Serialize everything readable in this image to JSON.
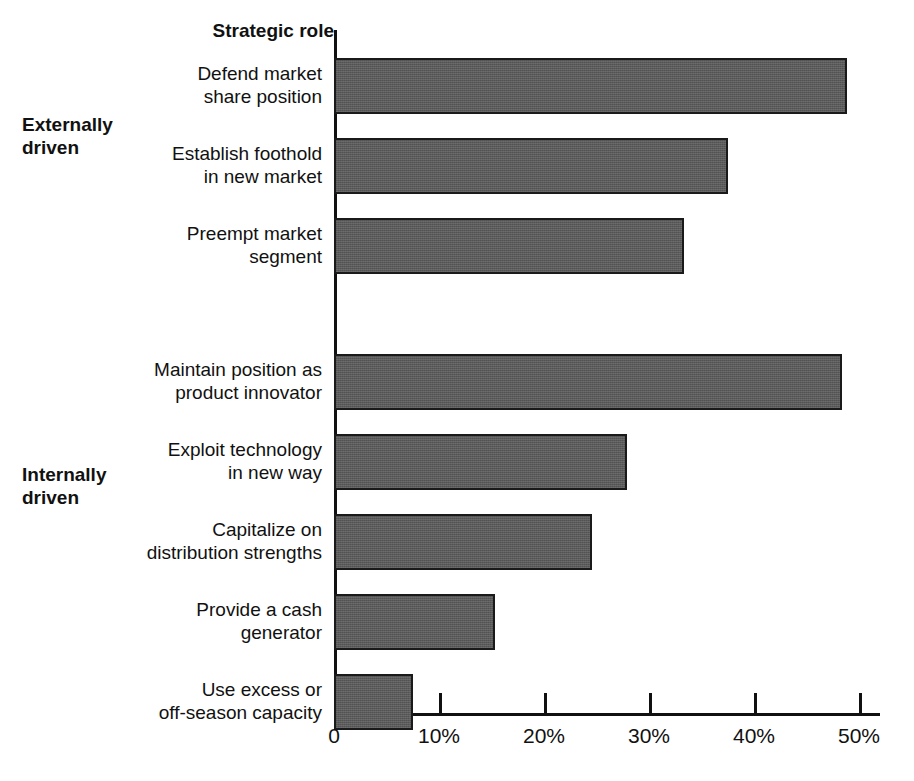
{
  "axis_header": "Strategic role",
  "groups": [
    {
      "id": "externally-driven",
      "label": "Externally\ndriven"
    },
    {
      "id": "internally-driven",
      "label": "Internally\ndriven"
    }
  ],
  "chart_data": {
    "type": "bar",
    "orientation": "horizontal",
    "title": "Strategic role",
    "xlabel": "",
    "ylabel": "Strategic role",
    "xlim": [
      0,
      52
    ],
    "grid": false,
    "legend": "none",
    "tick_labels": [
      "0",
      "10%",
      "20%",
      "30%",
      "40%",
      "50%"
    ],
    "tick_values": [
      0,
      10,
      20,
      30,
      40,
      50
    ],
    "groups": [
      "Externally driven",
      "Internally driven"
    ],
    "categories": [
      "Defend market\nshare position",
      "Establish foothold\nin new market",
      "Preempt market\nsegment",
      "Maintain position as\nproduct innovator",
      "Exploit technology\nin new way",
      "Capitalize on\ndistribution strengths",
      "Provide a cash\ngenerator",
      "Use excess or\noff-season capacity"
    ],
    "values": [
      48.9,
      37.5,
      33.3,
      48.4,
      27.9,
      24.6,
      15.3,
      7.5
    ],
    "bars": [
      {
        "label": "Defend market\nshare position",
        "value": 48.9,
        "group": "Externally driven"
      },
      {
        "label": "Establish foothold\nin new market",
        "value": 37.5,
        "group": "Externally driven"
      },
      {
        "label": "Preempt market\nsegment",
        "value": 33.3,
        "group": "Externally driven"
      },
      {
        "label": "Maintain position as\nproduct innovator",
        "value": 48.4,
        "group": "Internally driven"
      },
      {
        "label": "Exploit technology\nin new way",
        "value": 27.9,
        "group": "Internally driven"
      },
      {
        "label": "Capitalize on\ndistribution strengths",
        "value": 24.6,
        "group": "Internally driven"
      },
      {
        "label": "Provide a cash\ngenerator",
        "value": 15.3,
        "group": "Internally driven"
      },
      {
        "label": "Use excess or\noff-season capacity",
        "value": 7.5,
        "group": "Internally driven"
      }
    ],
    "colors": {
      "bar_fill": "#5b5b5b",
      "bar_stroke": "#1a1a1a",
      "axis": "#111111",
      "background": "#ffffff",
      "text": "#111111"
    }
  }
}
